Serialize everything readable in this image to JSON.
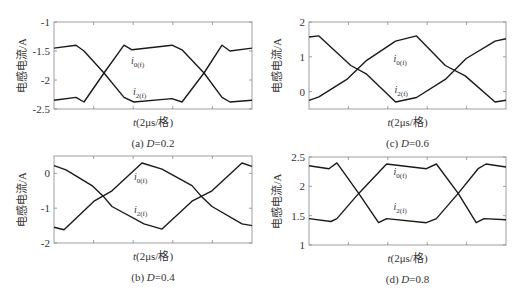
{
  "chart_data": [
    {
      "id": "a",
      "type": "line",
      "caption_prefix": "(a) ",
      "caption_var": "D",
      "caption_value": "=0.2",
      "xlabel": "t(2μs/格)",
      "ylabel": "电感电流/A",
      "ylim": [
        -2.5,
        -1
      ],
      "yticks": [
        "-1",
        "-1.5",
        "-2",
        "-2.5"
      ],
      "ytick_values": [
        -1,
        -1.5,
        -2,
        -2.5
      ],
      "xlim": [
        0,
        198
      ],
      "xtick_positions": [
        39.6,
        79.2,
        118.8,
        158.4
      ],
      "grid": false,
      "annotations": [
        {
          "text": "i",
          "sub": "0(f)",
          "x": 77,
          "y": -1.73
        },
        {
          "text": "i",
          "sub": "2(f)",
          "x": 79,
          "y": -2.26
        }
      ],
      "series": [
        {
          "name": "i0(f)",
          "x": [
            0,
            22,
            30,
            50,
            70,
            80,
            118,
            128,
            150,
            168,
            176,
            198
          ],
          "y": [
            -1.45,
            -1.4,
            -1.5,
            -1.88,
            -2.3,
            -2.38,
            -2.32,
            -2.38,
            -1.88,
            -1.4,
            -1.5,
            -1.45
          ]
        },
        {
          "name": "i2(f)",
          "x": [
            0,
            22,
            30,
            50,
            70,
            78,
            118,
            128,
            150,
            168,
            176,
            198
          ],
          "y": [
            -2.35,
            -2.3,
            -2.38,
            -1.88,
            -1.4,
            -1.48,
            -1.4,
            -1.48,
            -1.88,
            -2.3,
            -2.38,
            -2.35
          ]
        }
      ]
    },
    {
      "id": "c",
      "type": "line",
      "caption_prefix": "(c) ",
      "caption_var": "D",
      "caption_value": "=0.6",
      "xlabel": "t(2μs/格)",
      "ylabel": "电感电流/A",
      "ylim": [
        -0.5,
        2
      ],
      "yticks": [
        "2",
        "1",
        "0"
      ],
      "ytick_values": [
        2,
        1,
        0
      ],
      "xlim": [
        0,
        198
      ],
      "xtick_positions": [
        39.6,
        79.2,
        118.8,
        158.4
      ],
      "grid": false,
      "annotations": [
        {
          "text": "i",
          "sub": "0(f)",
          "x": 85,
          "y": 0.85
        },
        {
          "text": "i",
          "sub": "2(f)",
          "x": 86,
          "y": -0.05
        }
      ],
      "series": [
        {
          "name": "i2(f)",
          "x": [
            0,
            10,
            42,
            58,
            87,
            108,
            137,
            158,
            187,
            198
          ],
          "y": [
            1.57,
            1.6,
            0.75,
            0.5,
            -0.3,
            -0.17,
            0.35,
            0.95,
            1.45,
            1.52
          ]
        },
        {
          "name": "i0(f)",
          "x": [
            0,
            10,
            38,
            58,
            87,
            108,
            137,
            157,
            187,
            198
          ],
          "y": [
            -0.25,
            -0.15,
            0.35,
            0.9,
            1.45,
            1.6,
            0.75,
            0.45,
            -0.3,
            -0.25
          ]
        }
      ]
    },
    {
      "id": "b",
      "type": "line",
      "caption_prefix": "(b) ",
      "caption_var": "D",
      "caption_value": "=0.4",
      "xlabel": "t(2μs/格)",
      "ylabel": "电感电流/A",
      "ylim": [
        -2,
        0.5
      ],
      "yticks": [
        "0",
        "-1",
        "-2"
      ],
      "ytick_values": [
        0,
        -1,
        -2
      ],
      "xlim": [
        0,
        198
      ],
      "xtick_positions": [
        39.6,
        79.2,
        118.8,
        158.4
      ],
      "grid": false,
      "annotations": [
        {
          "text": "i",
          "sub": "0(f)",
          "x": 80,
          "y": -0.2
        },
        {
          "text": "i",
          "sub": "2(f)",
          "x": 80,
          "y": -1.15
        }
      ],
      "series": [
        {
          "name": "i2(f)",
          "x": [
            0,
            12,
            38,
            50,
            58,
            90,
            108,
            138,
            158,
            188,
            198
          ],
          "y": [
            0.22,
            0.1,
            -0.35,
            -0.68,
            -0.95,
            -1.45,
            -1.6,
            -0.8,
            -0.5,
            0.3,
            0.2
          ]
        },
        {
          "name": "i0(f)",
          "x": [
            0,
            10,
            40,
            58,
            88,
            108,
            138,
            148,
            158,
            188,
            198
          ],
          "y": [
            -1.55,
            -1.62,
            -0.8,
            -0.5,
            0.3,
            0.12,
            -0.35,
            -0.68,
            -0.95,
            -1.45,
            -1.5
          ]
        }
      ]
    },
    {
      "id": "d",
      "type": "line",
      "caption_prefix": "(d) ",
      "caption_var": "D",
      "caption_value": "=0.8",
      "xlabel": "t(2μs/格)",
      "ylabel": "电感电流/A",
      "ylim": [
        1,
        2.5
      ],
      "yticks": [
        "2.5",
        "2",
        "1.5",
        "1"
      ],
      "ytick_values": [
        2.5,
        2,
        1.5,
        1
      ],
      "xlim": [
        0,
        198
      ],
      "xtick_positions": [
        39.6,
        79.2,
        118.8,
        158.4
      ],
      "grid": false,
      "annotations": [
        {
          "text": "i",
          "sub": "0(f)",
          "x": 85,
          "y": 2.2
        },
        {
          "text": "i",
          "sub": "2(f)",
          "x": 85,
          "y": 1.6
        }
      ],
      "series": [
        {
          "name": "i0(f)",
          "x": [
            0,
            20,
            28,
            50,
            70,
            78,
            118,
            128,
            150,
            170,
            178,
            198
          ],
          "y": [
            2.35,
            2.3,
            2.4,
            1.88,
            1.38,
            1.45,
            1.38,
            1.45,
            1.88,
            2.3,
            2.38,
            2.33
          ]
        },
        {
          "name": "i2(f)",
          "x": [
            0,
            22,
            28,
            50,
            78,
            118,
            128,
            150,
            168,
            176,
            198
          ],
          "y": [
            1.45,
            1.4,
            1.45,
            1.88,
            2.38,
            2.3,
            2.38,
            1.88,
            1.38,
            1.45,
            1.43
          ]
        }
      ]
    }
  ],
  "layout": {
    "panels": [
      {
        "left": 54,
        "top": 22,
        "width": 198,
        "height": 87
      },
      {
        "left": 309,
        "top": 22,
        "width": 197,
        "height": 87
      },
      {
        "left": 54,
        "top": 156,
        "width": 198,
        "height": 87
      },
      {
        "left": 309,
        "top": 157,
        "width": 197,
        "height": 88
      }
    ],
    "line_color": "#1a1a1a",
    "axis_color": "#888888"
  }
}
